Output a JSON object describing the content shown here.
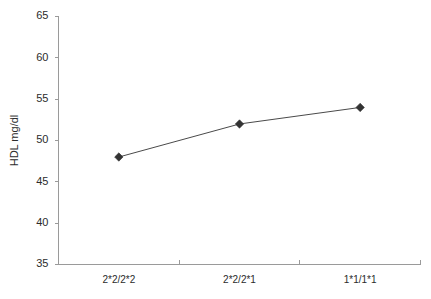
{
  "chart_data": {
    "type": "line",
    "title": "",
    "subtitle": "",
    "xlabel": "",
    "ylabel": "HDL mg/dl",
    "categories": [
      "2*2/2*2",
      "2*2/2*1",
      "1*1/1*1"
    ],
    "values": [
      48,
      52,
      54
    ],
    "series": [
      {
        "name": "HDL mg/dl",
        "values": [
          48,
          52,
          54
        ]
      }
    ],
    "ylim": [
      35,
      65
    ],
    "yticks": [
      35,
      40,
      45,
      50,
      55,
      60,
      65
    ],
    "ytick_labels": [
      "35",
      "40",
      "45",
      "50",
      "55",
      "60",
      "65"
    ],
    "grid": false,
    "legend": false,
    "legend_position": "none",
    "marker": "diamond",
    "colors": {
      "line": "#4a4a4a",
      "marker": "#333333",
      "axis": "#9a9a9a",
      "text": "#2b2b2b",
      "background": "#ffffff"
    }
  }
}
